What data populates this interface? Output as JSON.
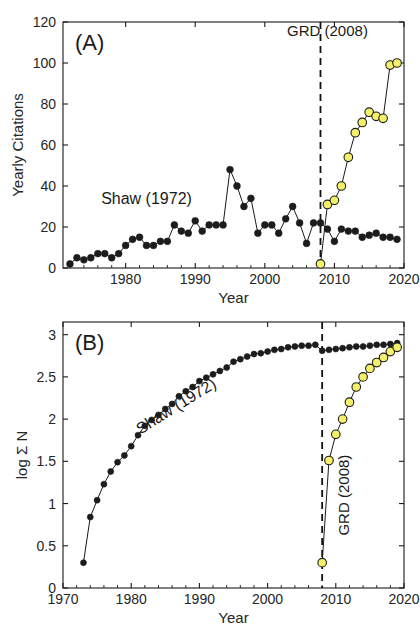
{
  "figure": {
    "background": "#ffffff",
    "foreground": "#1a1a1a",
    "series_colors": {
      "shaw": "#1c1c1c",
      "grd": "#f5f06a",
      "grd_edge": "#1c1c1c"
    }
  },
  "panelA": {
    "panel_label": "(A)",
    "event_label": "GRD (2008)",
    "series_label": "Shaw (1972)"
  },
  "panelB": {
    "panel_label": "(B)",
    "event_label": "GRD (2008)",
    "series_label": "Shaw (1972)"
  },
  "chart_data": [
    {
      "type": "line",
      "panel": "A",
      "title": "(A)",
      "xlabel": "Year",
      "ylabel": "Yearly Citations",
      "xlim": [
        1971,
        2020
      ],
      "ylim": [
        0,
        120
      ],
      "xticks": [
        1980,
        1990,
        2000,
        2010,
        2020
      ],
      "yticks": [
        0,
        20,
        40,
        60,
        80,
        100,
        120
      ],
      "grid": false,
      "legend": "none",
      "annotations": [
        {
          "text": "Shaw (1972)",
          "x": 1983,
          "y": 31
        },
        {
          "text": "GRD (2008)",
          "x": 2009,
          "y": 113
        }
      ],
      "vline": {
        "x": 2008,
        "style": "dashed",
        "label": "GRD (2008)"
      },
      "series": [
        {
          "name": "Shaw (1972)",
          "color": "#1c1c1c",
          "marker": "filled-circle",
          "x": [
            1972,
            1973,
            1974,
            1975,
            1976,
            1977,
            1978,
            1979,
            1980,
            1981,
            1982,
            1983,
            1984,
            1985,
            1986,
            1987,
            1988,
            1989,
            1990,
            1991,
            1992,
            1993,
            1994,
            1995,
            1996,
            1997,
            1998,
            1999,
            2000,
            2001,
            2002,
            2003,
            2004,
            2005,
            2006,
            2007,
            2008,
            2009,
            2010,
            2011,
            2012,
            2013,
            2014,
            2015,
            2016,
            2017,
            2018,
            2019
          ],
          "y": [
            2,
            5,
            4,
            5,
            7,
            7,
            5,
            7,
            11,
            14,
            15,
            11,
            11,
            13,
            13,
            21,
            18,
            17,
            23,
            18,
            21,
            21,
            21,
            48,
            40,
            30,
            34,
            17,
            21,
            21,
            17,
            24,
            30,
            22,
            12,
            22,
            22,
            19,
            13,
            19,
            18,
            18,
            15,
            16,
            17,
            15,
            15,
            14
          ]
        },
        {
          "name": "GRD (2008)",
          "color": "#f5f06a",
          "marker": "filled-circle-outlined",
          "x": [
            2008,
            2009,
            2010,
            2011,
            2012,
            2013,
            2014,
            2015,
            2016,
            2017,
            2018,
            2019
          ],
          "y": [
            2,
            31,
            33,
            40,
            54,
            66,
            71,
            76,
            74,
            73,
            99,
            100
          ]
        }
      ]
    },
    {
      "type": "line",
      "panel": "B",
      "title": "(B)",
      "xlabel": "Year",
      "ylabel": "log Σ N",
      "xlim": [
        1970,
        2020
      ],
      "ylim": [
        0,
        3.15
      ],
      "xticks": [
        1970,
        1980,
        1990,
        2000,
        2010,
        2020
      ],
      "yticks": [
        0,
        0.5,
        1,
        1.5,
        2,
        2.5,
        3
      ],
      "grid": false,
      "legend": "none",
      "annotations": [
        {
          "text": "Shaw (1972)",
          "x": 1987,
          "y": 2.1,
          "rotation": -32
        },
        {
          "text": "GRD (2008)",
          "x": 2012,
          "y": 1.1,
          "rotation": -90
        }
      ],
      "vline": {
        "x": 2008,
        "style": "dashed",
        "label": "GRD (2008)"
      },
      "series": [
        {
          "name": "Shaw (1972)",
          "color": "#1c1c1c",
          "marker": "filled-circle",
          "x": [
            1973,
            1974,
            1975,
            1976,
            1977,
            1978,
            1979,
            1980,
            1981,
            1982,
            1983,
            1984,
            1985,
            1986,
            1987,
            1988,
            1989,
            1990,
            1991,
            1992,
            1993,
            1994,
            1995,
            1996,
            1997,
            1998,
            1999,
            2000,
            2001,
            2002,
            2003,
            2004,
            2005,
            2006,
            2007,
            2008,
            2009,
            2010,
            2011,
            2012,
            2013,
            2014,
            2015,
            2016,
            2017,
            2018,
            2019
          ],
          "y": [
            0.3,
            0.84,
            1.04,
            1.23,
            1.38,
            1.49,
            1.57,
            1.68,
            1.81,
            1.92,
            1.99,
            2.05,
            2.12,
            2.18,
            2.27,
            2.33,
            2.38,
            2.45,
            2.49,
            2.53,
            2.57,
            2.61,
            2.68,
            2.71,
            2.74,
            2.77,
            2.78,
            2.8,
            2.82,
            2.83,
            2.85,
            2.86,
            2.87,
            2.87,
            2.88,
            2.81,
            2.82,
            2.83,
            2.84,
            2.85,
            2.86,
            2.86,
            2.87,
            2.88,
            2.88,
            2.89,
            2.9
          ]
        },
        {
          "name": "GRD (2008)",
          "color": "#f5f06a",
          "marker": "filled-circle-outlined",
          "x": [
            2008,
            2009,
            2010,
            2011,
            2012,
            2013,
            2014,
            2015,
            2016,
            2017,
            2018,
            2019
          ],
          "y": [
            0.3,
            1.51,
            1.82,
            2.0,
            2.2,
            2.38,
            2.5,
            2.6,
            2.67,
            2.73,
            2.8,
            2.85
          ]
        }
      ]
    }
  ]
}
